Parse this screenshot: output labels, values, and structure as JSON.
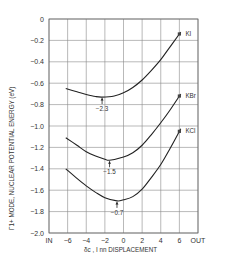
{
  "chart_data": {
    "type": "line",
    "title": "",
    "xlabel": "δ_c , I nn DISPLACEMENT",
    "ylabel": "Γ1+ MODE, NUCLEAR POTENTIAL ENERGY (eV)",
    "xlim": [
      -8,
      8
    ],
    "ylim": [
      -2.0,
      0
    ],
    "x_ticks": [
      -8,
      -6,
      -4,
      -2,
      0,
      2,
      4,
      6,
      8
    ],
    "x_tick_labels": [
      "IN",
      "-6",
      "-4",
      "-2",
      "0",
      "2",
      "4",
      "6",
      "OUT"
    ],
    "y_ticks": [
      0,
      -0.2,
      -0.4,
      -0.6,
      -0.8,
      -1.0,
      -1.2,
      -1.4,
      -1.6,
      -1.8,
      -2.0
    ],
    "y_tick_labels": [
      "0",
      "-0.2",
      "-0.4",
      "-0.6",
      "-0.8",
      "-1.0",
      "-1.2",
      "-1.4",
      "-1.6",
      "-1.8",
      "-2.0"
    ],
    "grid": true,
    "legend": "inline labels at right end of curves",
    "series": [
      {
        "name": "KI",
        "x": [
          -6.2,
          -5,
          -4,
          -3,
          -2.3,
          -1,
          0,
          1,
          2,
          3,
          4,
          5,
          6
        ],
        "y": [
          -0.65,
          -0.68,
          -0.705,
          -0.725,
          -0.73,
          -0.72,
          -0.69,
          -0.64,
          -0.57,
          -0.48,
          -0.38,
          -0.26,
          -0.14
        ],
        "minimum": {
          "x": -2.3,
          "y": -0.73,
          "annotation": "-2.3"
        }
      },
      {
        "name": "KBr",
        "x": [
          -6.2,
          -5,
          -4,
          -3,
          -2,
          -1.5,
          0,
          1,
          2,
          3,
          4,
          5,
          6
        ],
        "y": [
          -1.11,
          -1.18,
          -1.24,
          -1.28,
          -1.31,
          -1.32,
          -1.29,
          -1.25,
          -1.18,
          -1.08,
          -0.97,
          -0.85,
          -0.72
        ],
        "minimum": {
          "x": -1.5,
          "y": -1.32,
          "annotation": "-1.5"
        }
      },
      {
        "name": "KCl",
        "x": [
          -6.2,
          -5,
          -4,
          -3,
          -2,
          -0.7,
          0,
          1,
          2,
          3,
          4,
          5,
          6
        ],
        "y": [
          -1.4,
          -1.49,
          -1.56,
          -1.62,
          -1.67,
          -1.7,
          -1.69,
          -1.66,
          -1.59,
          -1.48,
          -1.36,
          -1.21,
          -1.05
        ],
        "minimum": {
          "x": -0.7,
          "y": -1.7,
          "annotation": "-0.7"
        }
      }
    ]
  },
  "labels": {
    "series_KI": "KI",
    "series_KBr": "KBr",
    "series_KCl": "KCl",
    "min_KI": "-2.3",
    "min_KBr": "-1.5",
    "min_KCl": "-0.7",
    "ylabel": "Γ1+ MODE, NUCLEAR POTENTIAL ENERGY (eV)",
    "xlabel": "δc , I nn DISPLACEMENT"
  }
}
